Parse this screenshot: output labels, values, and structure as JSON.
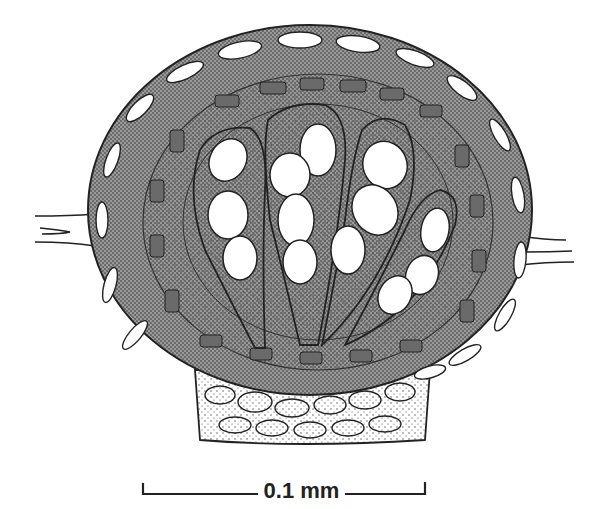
{
  "figure": {
    "style": "black-and-white stipple illustration",
    "colors": {
      "ink": "#222222",
      "background": "#ffffff",
      "stipple": "#555555",
      "dark_cell": "#6a6a6a"
    }
  },
  "scale_bar": {
    "label": "0.1 mm"
  }
}
